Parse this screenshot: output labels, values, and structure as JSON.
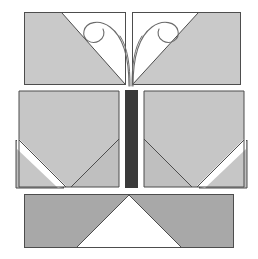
{
  "figure": {
    "width": 258,
    "height": 259,
    "background_color": "#ffffff"
  },
  "palette": {
    "page_background": "#ffffff",
    "panel_light": "#c9c9c9",
    "panel_light_alt": "#c6c6c6",
    "panel_mid": "#bfbfbf",
    "panel_dark": "#a8a8a8",
    "body_bar": "#3a3a3a",
    "outline": "#4d4d4d",
    "antenna_stroke": "#6b6b6b",
    "negative_space": "#ffffff"
  },
  "layout": {
    "blocks": [
      {
        "name": "top-wing-band",
        "label": "Top wing band",
        "x": 24,
        "y": 12,
        "width": 217,
        "height": 73
      },
      {
        "name": "middle-left-wing",
        "label": "Middle left wing",
        "x": 16,
        "y": 90,
        "width": 104,
        "height": 98
      },
      {
        "name": "body-bar",
        "label": "Butterfly body",
        "x": 125,
        "y": 90,
        "width": 13,
        "height": 98
      },
      {
        "name": "middle-right-wing",
        "label": "Middle right wing",
        "x": 143,
        "y": 90,
        "width": 104,
        "height": 98
      },
      {
        "name": "bottom-wing-band",
        "label": "Bottom wing band",
        "x": 24,
        "y": 194,
        "width": 210,
        "height": 54
      }
    ]
  },
  "shapes": {
    "top_left_panel": {
      "name": "top-left-wing-panel",
      "points": "25,13 125,13 125,84 25,84",
      "fill_key": "panel_light",
      "note": "left half of top band, diagonal white cut toward centre"
    },
    "top_left_cut": {
      "name": "top-left-diagonal-cut",
      "points": "125,13 125,84 63,13",
      "fill_key": "negative_space"
    },
    "top_right_panel": {
      "name": "top-right-wing-panel",
      "points": "133,13 240,13 240,84 133,84",
      "fill_key": "panel_light"
    },
    "top_right_cut": {
      "name": "top-right-diagonal-cut",
      "points": "133,13 133,84 197,13",
      "fill_key": "negative_space"
    },
    "mid_left_panel": {
      "name": "mid-left-wing-panel",
      "points": "19,91 119,91 119,187 66,187 19,140",
      "fill_key": "panel_light_alt"
    },
    "mid_left_inner_notch": {
      "name": "mid-left-inner-notch",
      "points": "119,139 119,187 71,187",
      "fill_key": "panel_mid"
    },
    "mid_left_outer_triangle": {
      "name": "mid-left-outer-triangle",
      "points": "16,140 16,188 64,188",
      "fill_key": "panel_mid"
    },
    "mid_left_white_slash": {
      "name": "mid-left-white-slash",
      "points": "17,138 63,184 58,189 17,148",
      "fill_key": "negative_space"
    },
    "mid_right_panel": {
      "name": "mid-right-wing-panel",
      "points": "144,91 244,91 244,140 197,187 144,187",
      "fill_key": "panel_light_alt"
    },
    "mid_right_inner_notch": {
      "name": "mid-right-inner-notch",
      "points": "144,139 144,187 192,187",
      "fill_key": "panel_mid"
    },
    "mid_right_outer_triangle": {
      "name": "mid-right-outer-triangle",
      "points": "247,140 247,188 199,188",
      "fill_key": "panel_mid"
    },
    "bottom_panel": {
      "name": "bottom-wing-panel",
      "points": "25,195 233,195 233,247 25,247",
      "fill_key": "panel_dark"
    },
    "bottom_notch": {
      "name": "bottom-centre-notch",
      "points": "129,195 181,247 77,247",
      "fill_key": "negative_space"
    },
    "body_bar": {
      "name": "body-bar-rect",
      "x": 125,
      "y": 90,
      "width": 13,
      "height": 98,
      "fill_key": "body_bar"
    }
  },
  "antennae": {
    "left": {
      "name": "left-antenna",
      "path": "M129,86 C129,60 125,38 110,27 C99,19 86,22 84,31 C82,40 92,45 99,41 C104,38 105,33 103,29",
      "stroke_key": "antenna_stroke",
      "stroke_width": 1.1
    },
    "right": {
      "name": "right-antenna",
      "path": "M133,86 C133,60 137,38 152,27 C163,19 176,22 178,31 C180,40 170,45 163,41 C158,38 157,33 159,29",
      "stroke_key": "antenna_stroke",
      "stroke_width": 1.1
    },
    "left_inner": {
      "name": "left-antenna-inner-stem",
      "path": "M130,86 C130,66 128,48 120,36",
      "stroke_key": "antenna_stroke",
      "stroke_width": 1.0
    },
    "right_inner": {
      "name": "right-antenna-inner-stem",
      "path": "M132,86 C132,66 134,48 142,36",
      "stroke_key": "antenna_stroke",
      "stroke_width": 1.0
    }
  }
}
